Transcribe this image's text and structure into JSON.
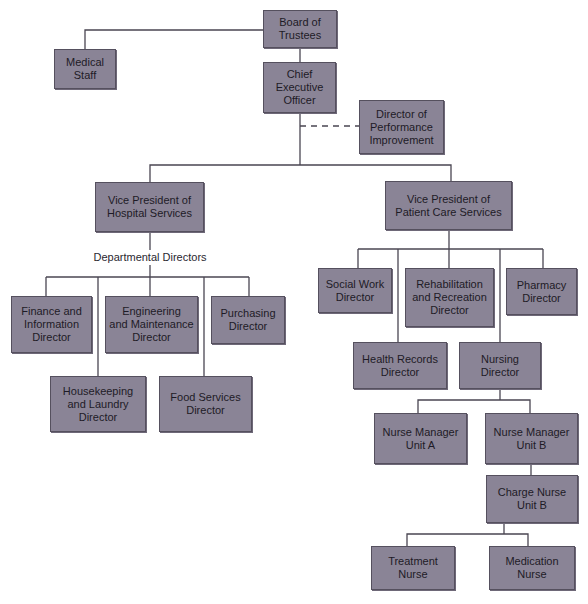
{
  "diagram": {
    "type": "organizational-chart",
    "nodes": [
      {
        "id": "board",
        "label": "Board of\nTrustees"
      },
      {
        "id": "medical",
        "label": "Medical\nStaff"
      },
      {
        "id": "ceo",
        "label": "Chief\nExecutive\nOfficer"
      },
      {
        "id": "perf",
        "label": "Director of\nPerformance\nImprovement"
      },
      {
        "id": "vph",
        "label": "Vice President of\nHospital Services"
      },
      {
        "id": "vpp",
        "label": "Vice President of\nPatient Care Services"
      },
      {
        "id": "finance",
        "label": "Finance and\nInformation\nDirector"
      },
      {
        "id": "engineering",
        "label": "Engineering\nand Maintenance\nDirector"
      },
      {
        "id": "purchasing",
        "label": "Purchasing\nDirector"
      },
      {
        "id": "housekeeping",
        "label": "Housekeeping\nand Laundry\nDirector"
      },
      {
        "id": "food",
        "label": "Food Services\nDirector"
      },
      {
        "id": "social",
        "label": "Social Work\nDirector"
      },
      {
        "id": "rehab",
        "label": "Rehabilitation\nand Recreation\nDirector"
      },
      {
        "id": "pharmacy",
        "label": "Pharmacy\nDirector"
      },
      {
        "id": "health",
        "label": "Health Records\nDirector"
      },
      {
        "id": "nursing",
        "label": "Nursing\nDirector"
      },
      {
        "id": "nma",
        "label": "Nurse Manager\nUnit A"
      },
      {
        "id": "nmb",
        "label": "Nurse Manager\nUnit B"
      },
      {
        "id": "charge",
        "label": "Charge Nurse\nUnit B"
      },
      {
        "id": "treatment",
        "label": "Treatment\nNurse"
      },
      {
        "id": "medication",
        "label": "Medication\nNurse"
      }
    ],
    "group_label": "Departmental Directors",
    "edges": [
      [
        "board",
        "medical"
      ],
      [
        "board",
        "ceo"
      ],
      [
        "ceo",
        "perf",
        "dashed"
      ],
      [
        "ceo",
        "vph"
      ],
      [
        "ceo",
        "vpp"
      ],
      [
        "vph",
        "finance"
      ],
      [
        "vph",
        "engineering"
      ],
      [
        "vph",
        "purchasing"
      ],
      [
        "vph",
        "housekeeping"
      ],
      [
        "vph",
        "food"
      ],
      [
        "vpp",
        "social"
      ],
      [
        "vpp",
        "rehab"
      ],
      [
        "vpp",
        "pharmacy"
      ],
      [
        "vpp",
        "health"
      ],
      [
        "vpp",
        "nursing"
      ],
      [
        "nursing",
        "nma"
      ],
      [
        "nursing",
        "nmb"
      ],
      [
        "nmb",
        "charge"
      ],
      [
        "charge",
        "treatment"
      ],
      [
        "charge",
        "medication"
      ]
    ],
    "colors": {
      "box_fill": "#8a8496",
      "box_border": "#55505e",
      "line": "#4a4652",
      "text": "#1e1b26"
    }
  }
}
